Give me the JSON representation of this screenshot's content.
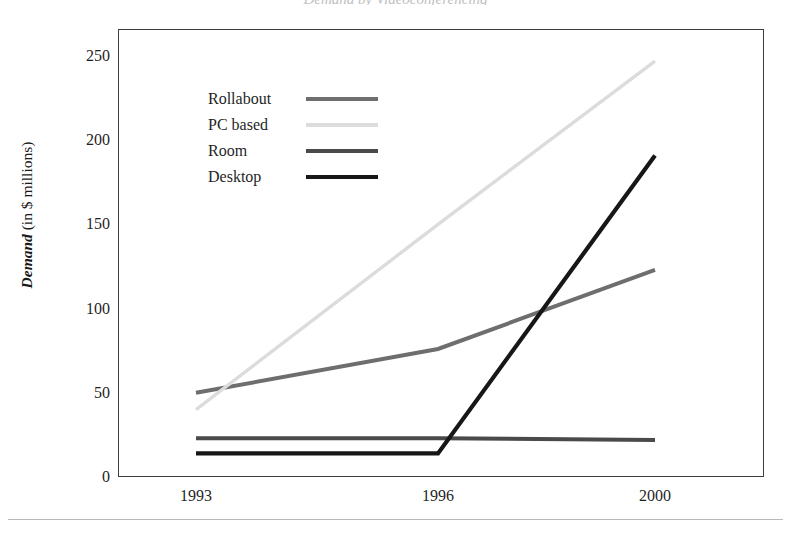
{
  "chart_data": {
    "type": "line",
    "title": "Demand by Videoconferencing",
    "xlabel": "",
    "ylabel": "Demand (in $ millions)",
    "ylabel_emphasis": "Demand",
    "ylabel_unit": " (in $ millions)",
    "categories": [
      "1993",
      "1996",
      "2000"
    ],
    "x": [
      1993,
      1996,
      2000
    ],
    "ylim": [
      0,
      250
    ],
    "yticks": [
      0,
      50,
      100,
      150,
      200,
      250
    ],
    "grid": false,
    "legend_position": "upper-left-inside",
    "series": [
      {
        "name": "Rollabout",
        "values": [
          50,
          76,
          123
        ],
        "color": "#6e6e6e",
        "width": 4.0
      },
      {
        "name": "PC based",
        "values": [
          40,
          150,
          247
        ],
        "color": "#dcdcdc",
        "width": 3.4
      },
      {
        "name": "Room",
        "values": [
          23,
          23,
          22
        ],
        "color": "#4a4a4a",
        "width": 4.0
      },
      {
        "name": "Desktop",
        "values": [
          14,
          14,
          191
        ],
        "color": "#171717",
        "width": 4.2
      }
    ]
  },
  "axis": {
    "y_tick_labels": [
      "250",
      "200",
      "150",
      "100",
      "50",
      "0"
    ],
    "x_tick_labels": [
      "1993",
      "1996",
      "2000"
    ]
  },
  "legend": {
    "items": [
      {
        "label": "Rollabout",
        "color": "#6e6e6e"
      },
      {
        "label": "PC based",
        "color": "#dcdcdc"
      },
      {
        "label": "Room",
        "color": "#4a4a4a"
      },
      {
        "label": "Desktop",
        "color": "#171717"
      }
    ]
  },
  "colors": {
    "frame": "#3d3d3d",
    "text": "#1f1f1f",
    "background": "#ffffff",
    "footer_rule": "#b9b9b9"
  }
}
